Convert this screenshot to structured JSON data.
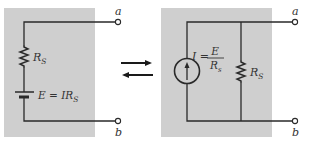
{
  "colors": {
    "background": "#ffffff",
    "panel": "#cfcfcf",
    "wire": "#2a2a2a",
    "text": "#333333"
  },
  "left_circuit": {
    "title": "voltage-source-equivalent",
    "resistor": {
      "label": "R",
      "subscript": "S"
    },
    "battery": {
      "label_prefix": "E = IR",
      "subscript": "S"
    },
    "terminal_top": "a",
    "terminal_bottom": "b"
  },
  "conversion_arrows": {
    "forward": "right-arrow",
    "backward": "left-arrow"
  },
  "right_circuit": {
    "title": "current-source-equivalent",
    "current_source": {
      "label": "I =",
      "numerator": "E",
      "denominator": "R",
      "denominator_subscript": "s"
    },
    "resistor": {
      "label": "R",
      "subscript": "S"
    },
    "terminal_top": "a",
    "terminal_bottom": "b"
  }
}
